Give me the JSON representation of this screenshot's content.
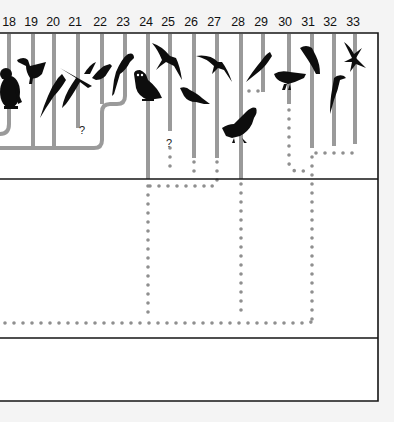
{
  "diagram": {
    "type": "phylogenetic-tree",
    "frame": {
      "left": 0,
      "right": 378,
      "top": 33,
      "bottom": 401,
      "band_lines": [
        179,
        338
      ]
    },
    "colors": {
      "branch": "#9a9a9a",
      "frame": "#111111",
      "silhouette": "#0d0d0d",
      "background": "#ffffff"
    },
    "columns": [
      {
        "label": "18",
        "x": 9,
        "bird": "penguin"
      },
      {
        "label": "19",
        "x": 33,
        "bird": "pelican"
      },
      {
        "label": "20",
        "x": 54,
        "bird": "cormorant"
      },
      {
        "label": "21",
        "x": 78,
        "bird": "flamingo"
      },
      {
        "label": "22",
        "x": 102,
        "bird": "pigeon"
      },
      {
        "label": "23",
        "x": 125,
        "bird": "parrot"
      },
      {
        "label": "24",
        "x": 148,
        "bird": "owl"
      },
      {
        "label": "25",
        "x": 170,
        "bird": "nightjar"
      },
      {
        "label": "26",
        "x": 194,
        "bird": "cuckoo"
      },
      {
        "label": "27",
        "x": 217,
        "bird": "swift"
      },
      {
        "label": "28",
        "x": 241,
        "bird": "thrush"
      },
      {
        "label": "29",
        "x": 263,
        "bird": "trogon"
      },
      {
        "label": "30",
        "x": 289,
        "bird": "finch"
      },
      {
        "label": "31",
        "x": 312,
        "bird": "waxwing"
      },
      {
        "label": "32",
        "x": 334,
        "bird": "woodpecker"
      },
      {
        "label": "33",
        "x": 355,
        "bird": "hummingbird"
      }
    ],
    "question_marks": [
      {
        "label": "?",
        "x": 78,
        "y": 125
      },
      {
        "label": "?",
        "x": 165,
        "y": 138
      }
    ]
  }
}
